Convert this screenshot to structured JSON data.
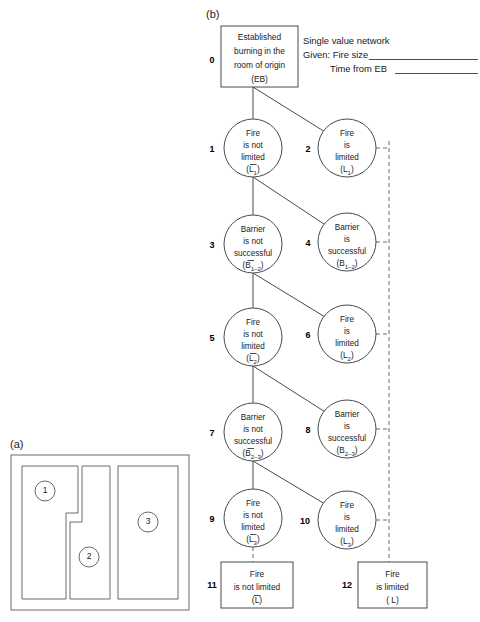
{
  "figure": {
    "panel_a_label": "(a)",
    "panel_b_label": "(b)"
  },
  "legend": {
    "title": "Single value network",
    "given_line1": "Given: Fire size",
    "given_line2": "Time from EB"
  },
  "network": {
    "root": {
      "index": "0",
      "lines": [
        "Established",
        "burning in the",
        "room of origin",
        "(EB)"
      ]
    },
    "nodes": [
      {
        "index": "1",
        "lines": [
          "Fire",
          "is not",
          "limited"
        ],
        "symbol_pre": "(",
        "symbol_base": "L",
        "symbol_bar": true,
        "symbol_sub": "1",
        "symbol_post": ")"
      },
      {
        "index": "2",
        "lines": [
          "Fire",
          "is",
          "limited"
        ],
        "symbol_pre": "(",
        "symbol_base": "L",
        "symbol_bar": false,
        "symbol_sub": "1",
        "symbol_post": ")"
      },
      {
        "index": "3",
        "lines": [
          "Barrier",
          "is not",
          "successful"
        ],
        "symbol_pre": "(",
        "symbol_base": "B",
        "symbol_bar": true,
        "symbol_sub": "1–2",
        "symbol_post": ")"
      },
      {
        "index": "4",
        "lines": [
          "Barrier",
          "is",
          "successful"
        ],
        "symbol_pre": "(",
        "symbol_base": "B",
        "symbol_bar": false,
        "symbol_sub": "1–2",
        "symbol_post": ")"
      },
      {
        "index": "5",
        "lines": [
          "Fire",
          "is not",
          "limited"
        ],
        "symbol_pre": "(",
        "symbol_base": "L",
        "symbol_bar": true,
        "symbol_sub": "2",
        "symbol_post": ")"
      },
      {
        "index": "6",
        "lines": [
          "Fire",
          "is",
          "limited"
        ],
        "symbol_pre": "(",
        "symbol_base": "L",
        "symbol_bar": false,
        "symbol_sub": "2",
        "symbol_post": ")"
      },
      {
        "index": "7",
        "lines": [
          "Barrier",
          "is not",
          "successful"
        ],
        "symbol_pre": "(",
        "symbol_base": "B",
        "symbol_bar": true,
        "symbol_sub": "2–3",
        "symbol_post": ")"
      },
      {
        "index": "8",
        "lines": [
          "Barrier",
          "is",
          "successful"
        ],
        "symbol_pre": "(",
        "symbol_base": "B",
        "symbol_bar": false,
        "symbol_sub": "2–3",
        "symbol_post": ")"
      },
      {
        "index": "9",
        "lines": [
          "Fire",
          "is not",
          "limited"
        ],
        "symbol_pre": "(",
        "symbol_base": "L",
        "symbol_bar": true,
        "symbol_sub": "3",
        "symbol_post": ")"
      },
      {
        "index": "10",
        "lines": [
          "Fire",
          "is",
          "limited"
        ],
        "symbol_pre": "(",
        "symbol_base": "L",
        "symbol_bar": false,
        "symbol_sub": "3",
        "symbol_post": ")"
      }
    ],
    "terminals": [
      {
        "index": "11",
        "lines": [
          "Fire",
          "is not limited"
        ],
        "symbol_pre": "(",
        "symbol_base": "L",
        "symbol_bar": true,
        "symbol_post": ")"
      },
      {
        "index": "12",
        "lines": [
          "Fire",
          "is limited"
        ],
        "symbol_pre": "( ",
        "symbol_base": "L",
        "symbol_bar": false,
        "symbol_post": ")"
      }
    ]
  },
  "floorplan": {
    "rooms": [
      {
        "label": "1"
      },
      {
        "label": "2"
      },
      {
        "label": "3"
      }
    ]
  }
}
